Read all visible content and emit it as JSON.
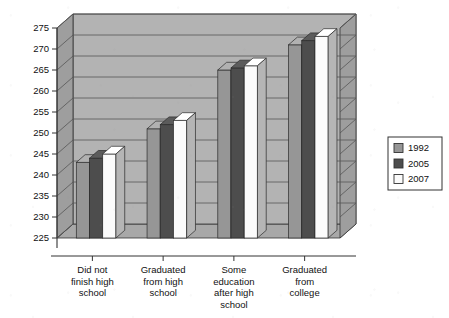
{
  "chart_data": {
    "type": "bar",
    "title": "",
    "subtitle": "",
    "xlabel": "",
    "ylabel": "",
    "ylim": [
      225,
      275
    ],
    "ytick_step": 5,
    "yticks": [
      225,
      230,
      235,
      240,
      245,
      250,
      255,
      260,
      265,
      270,
      275
    ],
    "grid": true,
    "three_d": true,
    "legend_position": "right",
    "categories": [
      "Did not finish high school",
      "Graduated from high school",
      "Some education after high school",
      "Graduated from college"
    ],
    "category_lines": [
      [
        "Did not",
        "finish high",
        "school"
      ],
      [
        "Graduated",
        "from high",
        "school"
      ],
      [
        "Some",
        "education",
        "after high",
        "school"
      ],
      [
        "Graduated",
        "from",
        "college"
      ]
    ],
    "series": [
      {
        "name": "1992",
        "color": "#969696",
        "values": [
          243,
          251,
          265,
          271
        ]
      },
      {
        "name": "2005",
        "color": "#4d4d4d",
        "values": [
          244,
          252,
          265.5,
          272
        ]
      },
      {
        "name": "2007",
        "color": "#fbfbfb",
        "values": [
          245,
          253,
          266,
          273
        ]
      }
    ]
  },
  "legend": {
    "items": [
      {
        "label": "1992",
        "color": "#969696"
      },
      {
        "label": "2005",
        "color": "#4d4d4d"
      },
      {
        "label": "2007",
        "color": "#fbfbfb"
      }
    ]
  },
  "axis": {
    "y_tick_labels": [
      "275",
      "270",
      "265",
      "260",
      "255",
      "250",
      "245",
      "240",
      "235",
      "230",
      "225"
    ]
  },
  "colors": {
    "plot_back_wall": "#b3b3b3",
    "plot_side_wall": "#9e9e9e",
    "floor": "#a8a8a8",
    "floor_front": "#949494",
    "gridline": "#555555",
    "axis_line": "#333333",
    "series_1992": "#969696",
    "series_2005": "#4d4d4d",
    "series_2007": "#fbfbfb",
    "background": "#ffffff"
  }
}
